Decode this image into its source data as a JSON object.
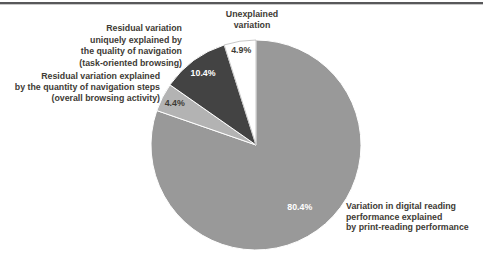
{
  "figure": {
    "annotations": {
      "top": [
        "Unexplained",
        "variation"
      ],
      "left1": [
        "Residual variation",
        "uniquely explained by",
        "the quality of navigation",
        "(task-oriented browsing)"
      ],
      "left2": [
        "Residual variation explained",
        "by the quantity of navigation steps",
        "(overall browsing activity)"
      ],
      "right": [
        "Variation in digital reading",
        "performance explained",
        "by print-reading performance"
      ]
    },
    "rule_color": "#58585a",
    "text_color": "#3e3b35"
  },
  "chart_data": {
    "type": "pie",
    "title": "",
    "start_angle_deg": 0,
    "direction": "clockwise",
    "center": [
      256,
      145
    ],
    "radius": 105,
    "legend_position": "annotations-around-pie",
    "slices": [
      {
        "label": "Variation in digital reading performance explained by print-reading performance",
        "value": 80.4,
        "pct_label": "80.4%",
        "color": "#999999",
        "pct_color": "#ffffff",
        "label_r": 0.72
      },
      {
        "label": "Residual variation explained by the quantity of navigation steps (overall browsing activity)",
        "value": 4.4,
        "pct_label": "4.4%",
        "color": "#b3b3b3",
        "pct_color": "#3e3b35",
        "label_r": 0.87
      },
      {
        "label": "Residual variation uniquely explained by the quality of navigation (task-oriented browsing)",
        "value": 10.4,
        "pct_label": "10.4%",
        "color": "#434343",
        "pct_color": "#ffffff",
        "label_r": 0.85
      },
      {
        "label": "Unexplained variation",
        "value": 4.9,
        "pct_label": "4.9%",
        "color": "#ffffff",
        "pct_color": "#3e3b35",
        "label_r": 0.92,
        "stroke": "#b0b0b0"
      }
    ]
  }
}
